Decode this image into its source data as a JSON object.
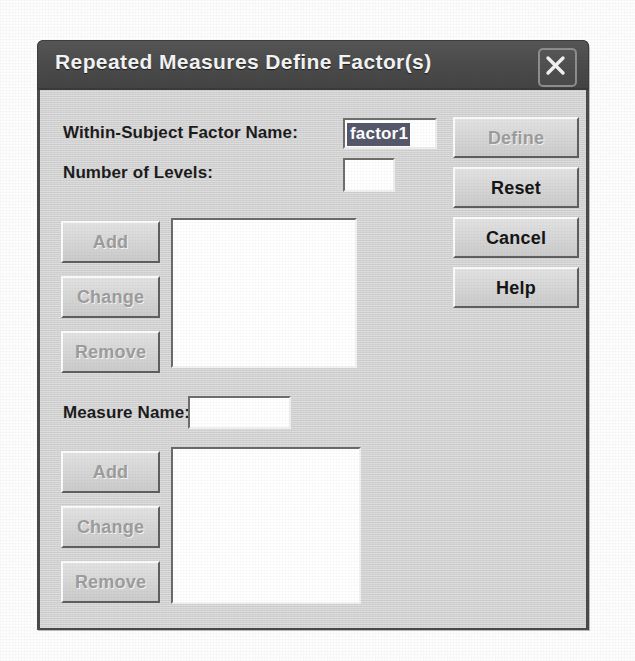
{
  "window": {
    "title": "Repeated Measures Define Factor(s)",
    "close_icon": "close-x-icon",
    "titlebar_color": "#4a4a4a",
    "body_color": "#d4d4d4"
  },
  "form": {
    "factor_name_label": "Within-Subject Factor Name:",
    "factor_name_value": "factor1",
    "factor_name_placeholder": "",
    "factor_name_selected": true,
    "levels_label": "Number of Levels:",
    "levels_value": "",
    "levels_placeholder": "",
    "measure_name_label": "Measure Name:",
    "measure_name_value": "",
    "measure_name_placeholder": ""
  },
  "factor_buttons": [
    {
      "label": "Add",
      "name": "factor-add-button",
      "disabled": true
    },
    {
      "label": "Change",
      "name": "factor-change-button",
      "disabled": true
    },
    {
      "label": "Remove",
      "name": "factor-remove-button",
      "disabled": true
    }
  ],
  "measure_buttons": [
    {
      "label": "Add",
      "name": "measure-add-button",
      "disabled": true
    },
    {
      "label": "Change",
      "name": "measure-change-button",
      "disabled": true
    },
    {
      "label": "Remove",
      "name": "measure-remove-button",
      "disabled": true
    }
  ],
  "action_buttons": [
    {
      "label": "Define",
      "name": "define-button",
      "disabled": true
    },
    {
      "label": "Reset",
      "name": "reset-button",
      "disabled": false
    },
    {
      "label": "Cancel",
      "name": "cancel-button",
      "disabled": false
    },
    {
      "label": "Help",
      "name": "help-button",
      "disabled": false
    }
  ],
  "factor_list": {
    "items": []
  },
  "measure_list": {
    "items": []
  }
}
